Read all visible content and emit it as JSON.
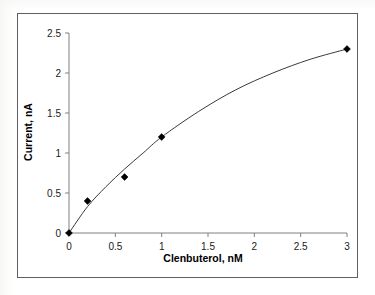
{
  "chart_data": {
    "type": "scatter",
    "title": "",
    "xlabel": "Clenbuterol, nM",
    "ylabel": "Current, nA",
    "x_tick_labels": [
      "0",
      "0.5",
      "1",
      "1.5",
      "2",
      "2.5",
      "3"
    ],
    "y_tick_labels": [
      "0",
      "0.5",
      "1",
      "1.5",
      "2",
      "2.5"
    ],
    "x_axis_type": "category-spaced",
    "xlim": [
      0,
      3
    ],
    "ylim": [
      0,
      2.5
    ],
    "grid": false,
    "legend": "none",
    "marker": "diamond",
    "series": [
      {
        "name": "Current response",
        "x": [
          0,
          0.2,
          0.6,
          1,
          3
        ],
        "values": [
          0,
          0.4,
          0.7,
          1.2,
          2.3
        ]
      }
    ],
    "fit_curve": {
      "description": "smooth saturating calibration curve through data points",
      "x": [
        0,
        0.2,
        0.4,
        0.6,
        0.8,
        1,
        1.4,
        1.8,
        2.2,
        2.6,
        3
      ],
      "y": [
        0,
        0.33,
        0.58,
        0.8,
        1.0,
        1.2,
        1.52,
        1.79,
        2.0,
        2.17,
        2.3
      ]
    }
  },
  "axes": {
    "x_title": "Clenbuterol, nM",
    "y_title": "Current, nA"
  },
  "colors": {
    "frame": "#5f5f5f",
    "axis": "#808080",
    "curve": "#3a3a3a",
    "marker": "#000000",
    "background": "#ffffff"
  }
}
